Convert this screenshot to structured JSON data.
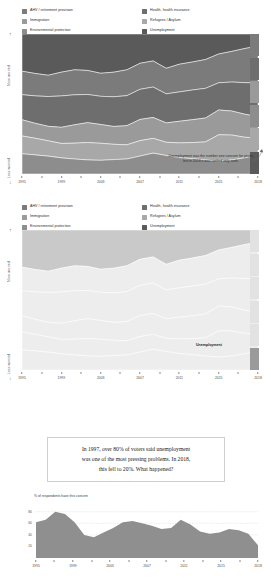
{
  "colors": {
    "ahv": "#7b7b7b",
    "immigration": "#9a9a9a",
    "environment": "#8d8d8d",
    "health": "#6e6e6e",
    "refugees": "#a8a8a8",
    "unemployment": "#5a5a5a",
    "area_fill": "#8f8f8f",
    "grid": "#bdbdbd",
    "axis": "#8a8a8a",
    "text": "#2b2b2b",
    "box_border": "#cfcfcf"
  },
  "legend": {
    "items": [
      {
        "label": "AHV / retirement provision",
        "color_key": "ahv",
        "icon": "legend-swatch"
      },
      {
        "label": "Health, health insurance",
        "color_key": "health",
        "icon": "legend-swatch"
      },
      {
        "label": "Immigration",
        "color_key": "immigration",
        "icon": "legend-swatch"
      },
      {
        "label": "Refugees / Asylum",
        "color_key": "refugees",
        "icon": "legend-swatch"
      },
      {
        "label": "Environmental protection",
        "color_key": "environment",
        "icon": "legend-swatch"
      },
      {
        "label": "Unemployment",
        "color_key": "unemployment",
        "icon": "legend-swatch"
      }
    ]
  },
  "chart1": {
    "y_top_label": "More worried",
    "y_bottom_label": "Less worried",
    "annotation": "Unemployment was the number one concern for years, but in 2018 it was ranked only sixth.",
    "series_tag": "",
    "axis_years": [
      "1995",
      "1999",
      "2003",
      "2007",
      "2011",
      "2015",
      "2018"
    ]
  },
  "chart2": {
    "y_top_label": "More worried",
    "y_bottom_label": "Less worried",
    "series_tag": "Unemployment",
    "axis_years": [
      "1995",
      "1999",
      "2003",
      "2007",
      "2011",
      "2015",
      "2018"
    ]
  },
  "quote": {
    "line1": "In 1997, over 80% of voters said unemployment",
    "line2": "was one of the most pressing problems. In 2018,",
    "line3": "this fell to 20%. What happened?"
  },
  "chart3": {
    "axis_title": "% of respondents have this concern",
    "y_ticks": [
      "80",
      "60",
      "40",
      "20"
    ],
    "axis_years": [
      "1995",
      "1999",
      "2003",
      "2007",
      "2011",
      "2015",
      "2018"
    ]
  },
  "chart_data": [
    {
      "id": "chart1",
      "type": "area",
      "title": "",
      "subtitle": "",
      "xlabel": "",
      "ylabel": "Worry rank (More worried / Less worried)",
      "grid": false,
      "legend_position": "top",
      "x": [
        1995,
        1996,
        1997,
        1999,
        2000,
        2001,
        2003,
        2004,
        2005,
        2007,
        2008,
        2009,
        2011,
        2012,
        2013,
        2015,
        2016,
        2017,
        2018
      ],
      "categories": [
        "1995",
        "1999",
        "2003",
        "2007",
        "2011",
        "2015",
        "2018"
      ],
      "annotations": [
        {
          "text": "Unemployment was the number one concern for years, but in 2018 it was ranked only sixth.",
          "x": 2016,
          "y": 0.25
        }
      ],
      "series": [
        {
          "name": "Unemployment",
          "values": [
            92,
            95,
            97,
            90,
            86,
            88,
            92,
            90,
            86,
            72,
            62,
            78,
            70,
            66,
            62,
            50,
            42,
            34,
            28
          ]
        },
        {
          "name": "AHV / retirement provision",
          "values": [
            58,
            54,
            50,
            56,
            60,
            58,
            54,
            58,
            62,
            64,
            60,
            58,
            64,
            66,
            70,
            72,
            74,
            80,
            86
          ]
        },
        {
          "name": "Health, health insurance",
          "values": [
            62,
            66,
            70,
            74,
            72,
            68,
            66,
            70,
            72,
            74,
            70,
            66,
            68,
            70,
            72,
            68,
            70,
            74,
            78
          ]
        },
        {
          "name": "Immigration",
          "values": [
            40,
            36,
            34,
            38,
            44,
            48,
            44,
            42,
            46,
            52,
            48,
            44,
            50,
            54,
            58,
            62,
            58,
            54,
            50
          ]
        },
        {
          "name": "Refugees / Asylum",
          "values": [
            44,
            40,
            36,
            34,
            38,
            42,
            40,
            36,
            34,
            38,
            34,
            30,
            34,
            38,
            44,
            66,
            60,
            48,
            40
          ]
        },
        {
          "name": "Environmental protection",
          "values": [
            50,
            46,
            42,
            38,
            36,
            34,
            32,
            34,
            36,
            44,
            48,
            42,
            38,
            36,
            34,
            32,
            34,
            38,
            44
          ]
        }
      ]
    },
    {
      "id": "chart2",
      "type": "area",
      "title": "",
      "subtitle": "",
      "xlabel": "",
      "ylabel": "Worry rank (More worried / Less worried)",
      "grid": false,
      "legend_position": "top",
      "highlight_series": "Unemployment",
      "categories": [
        "1995",
        "1999",
        "2003",
        "2007",
        "2011",
        "2015",
        "2018"
      ],
      "annotations": [
        {
          "text": "Unemployment",
          "x": 2018,
          "y": 0.58
        }
      ],
      "series": [
        {
          "name": "Unemployment",
          "values": [
            92,
            95,
            97,
            90,
            86,
            88,
            92,
            90,
            86,
            72,
            62,
            78,
            70,
            66,
            62,
            50,
            42,
            34,
            28
          ]
        },
        {
          "name": "AHV / retirement provision",
          "values": [
            58,
            54,
            50,
            56,
            60,
            58,
            54,
            58,
            62,
            64,
            60,
            58,
            64,
            66,
            70,
            72,
            74,
            80,
            86
          ]
        },
        {
          "name": "Health, health insurance",
          "values": [
            62,
            66,
            70,
            74,
            72,
            68,
            66,
            70,
            72,
            74,
            70,
            66,
            68,
            70,
            72,
            68,
            70,
            74,
            78
          ]
        },
        {
          "name": "Immigration",
          "values": [
            40,
            36,
            34,
            38,
            44,
            48,
            44,
            42,
            46,
            52,
            48,
            44,
            50,
            54,
            58,
            62,
            58,
            54,
            50
          ]
        },
        {
          "name": "Refugees / Asylum",
          "values": [
            44,
            40,
            36,
            34,
            38,
            42,
            40,
            36,
            34,
            38,
            34,
            30,
            34,
            38,
            44,
            66,
            60,
            48,
            40
          ]
        },
        {
          "name": "Environmental protection",
          "values": [
            50,
            46,
            42,
            38,
            36,
            34,
            32,
            34,
            36,
            44,
            48,
            42,
            38,
            36,
            34,
            32,
            34,
            38,
            44
          ]
        }
      ]
    },
    {
      "id": "chart3",
      "type": "area",
      "title": "% of respondents have this concern",
      "xlabel": "",
      "ylabel": "% of respondents have this concern",
      "ylim": [
        0,
        90
      ],
      "y_ticks": [
        20,
        40,
        60,
        80
      ],
      "grid": true,
      "legend_position": "none",
      "series_name": "Unemployment",
      "x": [
        1995,
        1996,
        1997,
        1998,
        1999,
        2000,
        2001,
        2002,
        2003,
        2004,
        2005,
        2006,
        2007,
        2008,
        2009,
        2010,
        2011,
        2012,
        2013,
        2014,
        2015,
        2016,
        2017,
        2018
      ],
      "values": [
        62,
        66,
        80,
        76,
        62,
        40,
        36,
        44,
        52,
        62,
        64,
        60,
        56,
        50,
        52,
        66,
        58,
        46,
        42,
        44,
        50,
        48,
        42,
        22
      ]
    }
  ]
}
